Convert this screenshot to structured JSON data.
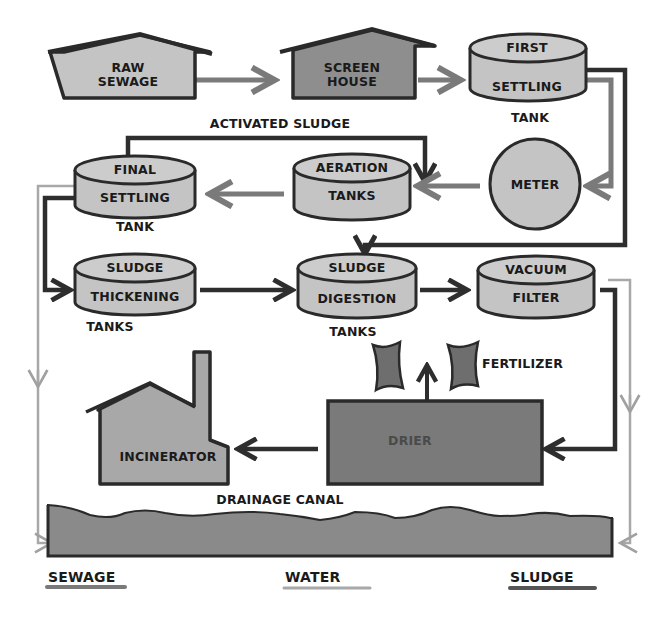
{
  "colors": {
    "background": "#ffffff",
    "light_fill": "#c4c4c4",
    "medium_fill": "#9a9a9a",
    "dark_fill": "#767676",
    "outline": "#2a2a2a",
    "sewage_line": "#7a7a7a",
    "water_line": "#a8a8a8",
    "sludge_line": "#2e2e2e"
  },
  "nodes": {
    "raw_sewage": {
      "line1": "RAW",
      "line2": "SEWAGE",
      "shape": "house"
    },
    "screen_house": {
      "line1": "SCREEN",
      "line2": "HOUSE",
      "shape": "house"
    },
    "first_settling": {
      "line1": "FIRST",
      "line2": "SETTLING",
      "caption": "TANK",
      "shape": "tank"
    },
    "meter": {
      "label": "METER",
      "shape": "circle"
    },
    "aeration": {
      "line1": "AERATION",
      "line2": "TANKS",
      "shape": "tank"
    },
    "final_settling": {
      "line1": "FINAL",
      "line2": "SETTLING",
      "caption": "TANK",
      "shape": "tank"
    },
    "sludge_thickening": {
      "line1": "SLUDGE",
      "line2": "THICKENING",
      "caption": "TANKS",
      "shape": "tank"
    },
    "sludge_digestion": {
      "line1": "SLUDGE",
      "line2": "DIGESTION",
      "caption": "TANKS",
      "shape": "tank"
    },
    "vacuum_filter": {
      "line1": "VACUUM",
      "line2": "FILTER",
      "shape": "tank"
    },
    "drier": {
      "label": "DRIER",
      "shape": "box"
    },
    "incinerator": {
      "label": "INCINERATOR",
      "shape": "factory"
    },
    "fertilizer": {
      "label": "FERTILIZER",
      "shape": "bags"
    },
    "drainage_canal": {
      "label": "DRAINAGE CANAL",
      "shape": "water"
    }
  },
  "annotations": {
    "activated_sludge": "ACTIVATED SLUDGE"
  },
  "edges": [
    {
      "from": "raw_sewage",
      "to": "screen_house",
      "type": "sewage"
    },
    {
      "from": "screen_house",
      "to": "first_settling",
      "type": "sewage"
    },
    {
      "from": "first_settling",
      "to": "meter",
      "type": "sewage"
    },
    {
      "from": "first_settling",
      "to": "sludge_digestion",
      "type": "sludge"
    },
    {
      "from": "meter",
      "to": "aeration",
      "type": "sewage"
    },
    {
      "from": "final_settling",
      "to": "aeration",
      "type": "sludge",
      "label": "ACTIVATED SLUDGE"
    },
    {
      "from": "aeration",
      "to": "final_settling",
      "type": "sewage"
    },
    {
      "from": "final_settling",
      "to": "sludge_thickening",
      "type": "sludge"
    },
    {
      "from": "final_settling",
      "to": "drainage_canal",
      "type": "water"
    },
    {
      "from": "sludge_thickening",
      "to": "sludge_digestion",
      "type": "sludge"
    },
    {
      "from": "sludge_digestion",
      "to": "vacuum_filter",
      "type": "sludge"
    },
    {
      "from": "vacuum_filter",
      "to": "drier",
      "type": "sludge"
    },
    {
      "from": "vacuum_filter",
      "to": "drainage_canal",
      "type": "water"
    },
    {
      "from": "drier",
      "to": "fertilizer",
      "type": "sludge"
    },
    {
      "from": "drier",
      "to": "incinerator",
      "type": "sludge"
    }
  ],
  "legend": {
    "items": [
      {
        "label": "SEWAGE",
        "color": "#7a7a7a"
      },
      {
        "label": "WATER",
        "color": "#a8a8a8"
      },
      {
        "label": "SLUDGE",
        "color": "#2e2e2e"
      }
    ]
  }
}
